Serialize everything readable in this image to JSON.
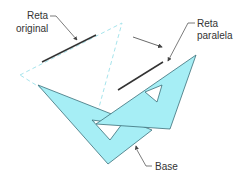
{
  "figure": {
    "labels": {
      "original_line_1": "Reta",
      "original_line_2": "original",
      "parallel_line_1": "Reta",
      "parallel_line_2": "paralela",
      "base": "Base"
    },
    "colors": {
      "set_square_fill": "#a6eef5",
      "set_square_stroke": "#3b6f78",
      "dashed_outline": "#a6e4ec",
      "line": "#333333",
      "arrow": "#444444",
      "leader": "#444444",
      "label_text": "#333333"
    }
  }
}
